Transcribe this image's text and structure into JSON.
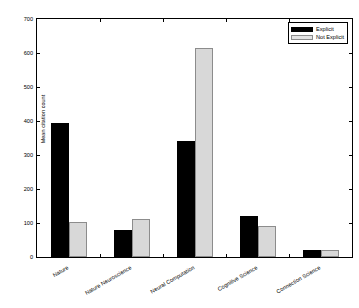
{
  "chart_data": {
    "type": "bar",
    "title": "",
    "xlabel": "",
    "ylabel": "Mean citation count",
    "ylim": [
      0,
      700
    ],
    "yticks": [
      0,
      100,
      200,
      300,
      400,
      500,
      600,
      700
    ],
    "ytick_labels": [
      "0",
      "100",
      "200",
      "300",
      "400",
      "500",
      "600",
      "700"
    ],
    "grid": false,
    "legend_position": "top-right",
    "categories": [
      "Nature",
      "Nature Neuroscience",
      "Neural Computation",
      "Cognitive Science",
      "Connection Science"
    ],
    "series": [
      {
        "name": "Explicit",
        "color": "#000000",
        "values": [
          394,
          78,
          341,
          122,
          22
        ]
      },
      {
        "name": "Not Explicit",
        "color": "#d8d8d8",
        "values": [
          102,
          112,
          615,
          90,
          21
        ]
      }
    ]
  },
  "legend": {
    "entries": [
      {
        "label": "Explicit",
        "swatch": "explicit"
      },
      {
        "label": "Not Explicit",
        "swatch": "notexplicit"
      }
    ]
  }
}
